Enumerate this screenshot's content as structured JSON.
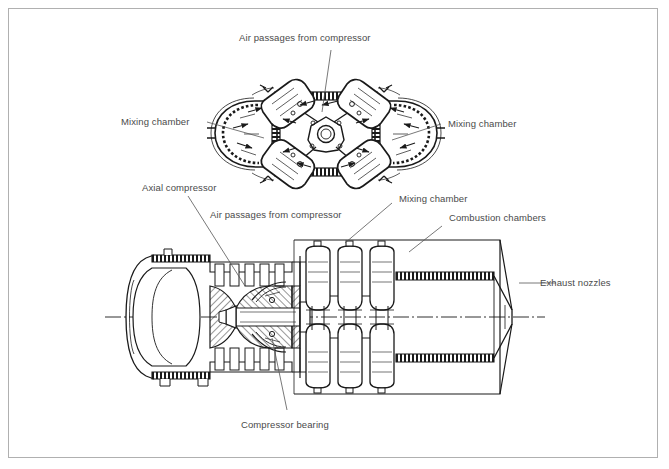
{
  "figure": {
    "type": "technical-cutaway-diagram",
    "background_color": "#ffffff",
    "frame_color": "#b0b0b0",
    "line_color": "#1a1a1a",
    "text_color": "#4a4a4a"
  },
  "labels": {
    "air_passages_top": "Air passages from compressor",
    "mixing_chamber_left": "Mixing chamber",
    "mixing_chamber_right": "Mixing chamber",
    "axial_compressor": "Axial compressor",
    "air_passages_lower": "Air passages from compressor",
    "mixing_chamber_lower": "Mixing chamber",
    "combustion_chambers": "Combustion chambers",
    "exhaust_nozzles": "Exhaust nozzles",
    "compressor_bearing": "Compressor bearing"
  },
  "views": {
    "upper": {
      "name": "transverse-section",
      "description": "Section showing four mixing chambers and radial air passages around central hub"
    },
    "lower": {
      "name": "longitudinal-section",
      "description": "Side cutaway showing intake, axial compressor, bearing, combustion chambers and exhaust nozzles"
    }
  },
  "centerline": {
    "style": "dash-dot",
    "y": 317
  }
}
